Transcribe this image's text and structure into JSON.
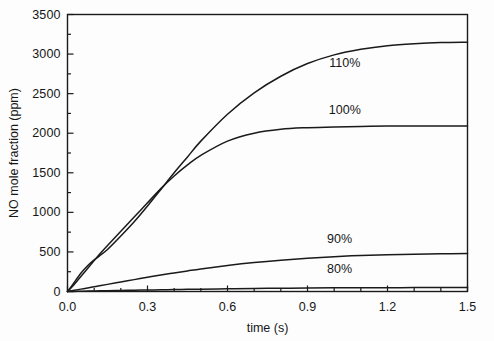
{
  "chart_data": {
    "type": "line",
    "title": "",
    "xlabel": "time (s)",
    "ylabel": "NO mole fraction (ppm)",
    "xlim": [
      0.0,
      1.5
    ],
    "ylim": [
      0,
      3500
    ],
    "xticks": [
      0.0,
      0.3,
      0.6,
      0.9,
      1.2,
      1.5
    ],
    "xtick_labels": [
      "0.0",
      "0.3",
      "0.6",
      "0.9",
      "1.2",
      "1.5"
    ],
    "yticks": [
      0,
      500,
      1000,
      1500,
      2000,
      2500,
      3000,
      3500
    ],
    "ytick_labels": [
      "0",
      "500",
      "1000",
      "1500",
      "2000",
      "2500",
      "3000",
      "3500"
    ],
    "x_minor_tick_step": 0.1,
    "y_minor_tick_step": 250,
    "grid": false,
    "legend_position": "inline-annotations",
    "line_color": "#1a1a1a",
    "background_color": "#ffffff",
    "x": [
      0.0,
      0.02,
      0.05,
      0.08,
      0.1,
      0.12,
      0.15,
      0.2,
      0.25,
      0.3,
      0.35,
      0.4,
      0.45,
      0.5,
      0.6,
      0.7,
      0.8,
      0.9,
      1.0,
      1.1,
      1.2,
      1.3,
      1.4,
      1.5
    ],
    "series": [
      {
        "name": "110%",
        "label": "110%",
        "label_x": 1.04,
        "label_y": 2880,
        "values": [
          0,
          90,
          230,
          340,
          400,
          450,
          530,
          700,
          880,
          1080,
          1290,
          1500,
          1700,
          1900,
          2240,
          2510,
          2720,
          2880,
          2990,
          3060,
          3105,
          3130,
          3145,
          3150
        ]
      },
      {
        "name": "100%",
        "label": "100%",
        "label_x": 1.04,
        "label_y": 2280,
        "values": [
          0,
          70,
          190,
          310,
          390,
          470,
          580,
          760,
          940,
          1120,
          1300,
          1460,
          1600,
          1720,
          1900,
          2000,
          2050,
          2070,
          2080,
          2085,
          2090,
          2090,
          2090,
          2090
        ]
      },
      {
        "name": "90%",
        "label": "90%",
        "label_x": 1.02,
        "label_y": 650,
        "values": [
          0,
          12,
          30,
          48,
          60,
          72,
          90,
          120,
          150,
          180,
          208,
          235,
          260,
          285,
          328,
          365,
          395,
          420,
          440,
          455,
          465,
          472,
          477,
          480
        ]
      },
      {
        "name": "80%",
        "label": "80%",
        "label_x": 1.02,
        "label_y": 270,
        "values": [
          0,
          1,
          3,
          5,
          6,
          8,
          10,
          13,
          16,
          19,
          22,
          25,
          27,
          30,
          34,
          38,
          41,
          44,
          46,
          47,
          48,
          49,
          50,
          50
        ]
      }
    ]
  },
  "axes": {
    "x_title": "time (s)",
    "y_title": "NO mole fraction (ppm)"
  }
}
